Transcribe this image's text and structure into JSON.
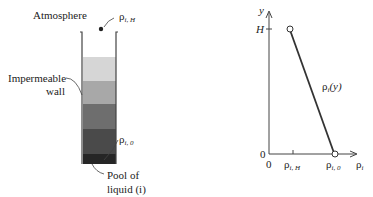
{
  "left_figure": {
    "atmosphere_label": "Atmosphere",
    "rho_top": {
      "symbol": "ρ",
      "sub": "i, H"
    },
    "wall_label_line1": "Impermeable",
    "wall_label_line2": "wall",
    "rho_bottom": {
      "symbol": "ρ",
      "sub": "i, 0"
    },
    "pool_label_line1": "Pool of",
    "pool_label_line2": "liquid (i)",
    "band_colors": [
      "#d6d6d6",
      "#a8a8a8",
      "#6e6e6e",
      "#4a4a4a",
      "#262626"
    ]
  },
  "right_figure": {
    "y_axis_label": "y",
    "h_tick_label": "H",
    "origin_y_label": "0",
    "origin_x_label": "0",
    "x_tick_rhoH": {
      "symbol": "ρ",
      "sub": "i, H"
    },
    "x_tick_rho0": {
      "symbol": "ρ",
      "sub": "i, 0"
    },
    "x_axis_label": {
      "symbol": "ρ",
      "sub": "i"
    },
    "curve_label": {
      "symbol": "ρ",
      "sub": "i",
      "arg": "(y)"
    }
  }
}
